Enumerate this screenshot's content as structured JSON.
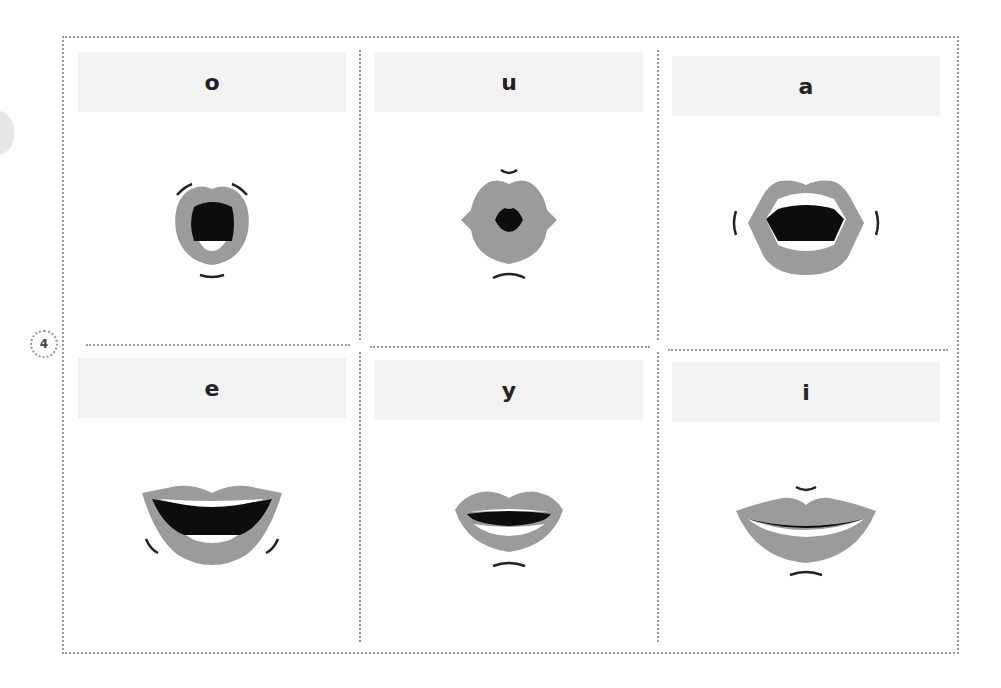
{
  "page": {
    "number": "4"
  },
  "colors": {
    "lip": "#9b9b9b",
    "mouth_interior": "#0d0d0d",
    "teeth": "#ffffff",
    "label_band": "#f2f2f2",
    "border": "#9a9a9a"
  },
  "cards": [
    {
      "vowel": "o",
      "mouth": "mouth-o-icon"
    },
    {
      "vowel": "u",
      "mouth": "mouth-u-icon"
    },
    {
      "vowel": "a",
      "mouth": "mouth-a-icon"
    },
    {
      "vowel": "e",
      "mouth": "mouth-e-icon"
    },
    {
      "vowel": "y",
      "mouth": "mouth-y-icon"
    },
    {
      "vowel": "i",
      "mouth": "mouth-i-icon"
    }
  ]
}
